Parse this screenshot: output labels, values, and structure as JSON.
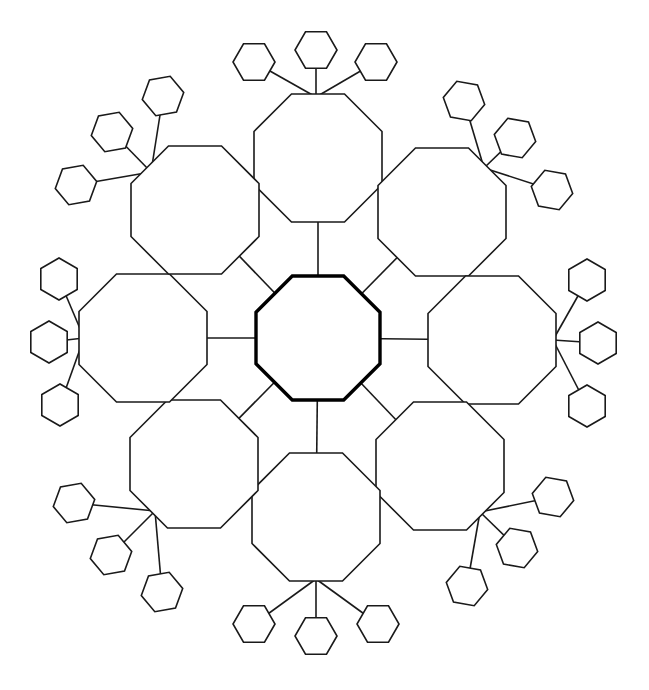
{
  "diagram": {
    "title": "",
    "type": "radial graphic organizer",
    "colors": {
      "stroke": "#1a1a1a",
      "center_stroke": "#000000",
      "fill": "#ffffff",
      "background": "#ffffff"
    },
    "center": {
      "label": "",
      "shape": "octagon",
      "cx": 318,
      "cy": 338,
      "r": 64
    },
    "branches": [
      {
        "id": "top",
        "label": "",
        "cx": 318,
        "cy": 158,
        "r": 64,
        "junction": [
          316,
          97
        ],
        "leaves": [
          {
            "label": "",
            "cx": 254,
            "cy": 62,
            "rot": 0
          },
          {
            "label": "",
            "cx": 316,
            "cy": 50,
            "rot": 0
          },
          {
            "label": "",
            "cx": 376,
            "cy": 62,
            "rot": 0
          }
        ]
      },
      {
        "id": "top-right",
        "label": "",
        "cx": 442,
        "cy": 212,
        "r": 64,
        "junction": [
          484,
          168
        ],
        "leaves": [
          {
            "label": "",
            "cx": 464,
            "cy": 101,
            "rot": 10
          },
          {
            "label": "",
            "cx": 515,
            "cy": 138,
            "rot": 10
          },
          {
            "label": "",
            "cx": 552,
            "cy": 190,
            "rot": 10
          }
        ]
      },
      {
        "id": "right",
        "label": "",
        "cx": 492,
        "cy": 340,
        "r": 64,
        "junction": [
          553,
          340
        ],
        "leaves": [
          {
            "label": "",
            "cx": 587,
            "cy": 280,
            "rot": 30
          },
          {
            "label": "",
            "cx": 598,
            "cy": 343,
            "rot": 30
          },
          {
            "label": "",
            "cx": 587,
            "cy": 406,
            "rot": 30
          }
        ]
      },
      {
        "id": "bottom-right",
        "label": "",
        "cx": 440,
        "cy": 466,
        "r": 64,
        "junction": [
          480,
          512
        ],
        "leaves": [
          {
            "label": "",
            "cx": 553,
            "cy": 497,
            "rot": 10
          },
          {
            "label": "",
            "cx": 517,
            "cy": 548,
            "rot": 10
          },
          {
            "label": "",
            "cx": 467,
            "cy": 586,
            "rot": 10
          }
        ]
      },
      {
        "id": "bottom",
        "label": "",
        "cx": 316,
        "cy": 517,
        "r": 64,
        "junction": [
          316,
          579
        ],
        "leaves": [
          {
            "label": "",
            "cx": 254,
            "cy": 624,
            "rot": 0
          },
          {
            "label": "",
            "cx": 316,
            "cy": 636,
            "rot": 0
          },
          {
            "label": "",
            "cx": 378,
            "cy": 624,
            "rot": 0
          }
        ]
      },
      {
        "id": "bottom-left",
        "label": "",
        "cx": 194,
        "cy": 464,
        "r": 64,
        "junction": [
          155,
          511
        ],
        "leaves": [
          {
            "label": "",
            "cx": 74,
            "cy": 503,
            "rot": -10
          },
          {
            "label": "",
            "cx": 111,
            "cy": 555,
            "rot": -10
          },
          {
            "label": "",
            "cx": 162,
            "cy": 592,
            "rot": -10
          }
        ]
      },
      {
        "id": "left",
        "label": "",
        "cx": 143,
        "cy": 338,
        "r": 64,
        "junction": [
          84,
          338
        ],
        "leaves": [
          {
            "label": "",
            "cx": 59,
            "cy": 279,
            "rot": 30
          },
          {
            "label": "",
            "cx": 49,
            "cy": 342,
            "rot": 30
          },
          {
            "label": "",
            "cx": 60,
            "cy": 405,
            "rot": 30
          }
        ]
      },
      {
        "id": "top-left",
        "label": "",
        "cx": 195,
        "cy": 210,
        "r": 64,
        "junction": [
          151,
          172
        ],
        "leaves": [
          {
            "label": "",
            "cx": 163,
            "cy": 96,
            "rot": -10
          },
          {
            "label": "",
            "cx": 112,
            "cy": 132,
            "rot": -10
          },
          {
            "label": "",
            "cx": 76,
            "cy": 185,
            "rot": -10
          }
        ]
      }
    ],
    "leaf_radius": 21
  }
}
